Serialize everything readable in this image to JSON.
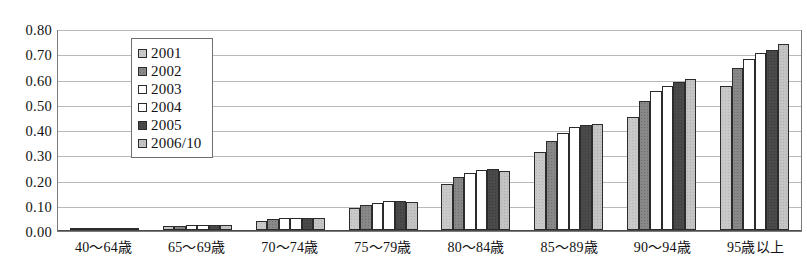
{
  "scan_artifact": {
    "top_clipped_text": " "
  },
  "chart_data": {
    "type": "bar",
    "title": "",
    "xlabel": "",
    "ylabel": "",
    "ylim": [
      0.0,
      0.8
    ],
    "yticks": [
      "0.00",
      "0.10",
      "0.20",
      "0.30",
      "0.40",
      "0.50",
      "0.60",
      "0.70",
      "0.80"
    ],
    "ytick_values": [
      0.0,
      0.1,
      0.2,
      0.3,
      0.4,
      0.5,
      0.6,
      0.7,
      0.8
    ],
    "grid": true,
    "legend_position": "upper-left-inside",
    "categories": [
      "40～64歳",
      "65～69歳",
      "70～74歳",
      "75～79歳",
      "80～84歳",
      "85～89歳",
      "90～94歳",
      "95歳以上"
    ],
    "series": [
      {
        "name": "2001",
        "color": "#c9c9c9",
        "values": [
          0.003,
          0.014,
          0.037,
          0.088,
          0.185,
          0.31,
          0.45,
          0.575
        ]
      },
      {
        "name": "2002",
        "color": "#888888",
        "values": [
          0.003,
          0.016,
          0.043,
          0.098,
          0.21,
          0.355,
          0.515,
          0.645
        ]
      },
      {
        "name": "2003",
        "color": "#ffffff",
        "values": [
          0.003,
          0.018,
          0.046,
          0.108,
          0.228,
          0.385,
          0.555,
          0.68
        ]
      },
      {
        "name": "2004",
        "color": "#ffffff",
        "values": [
          0.003,
          0.018,
          0.048,
          0.114,
          0.238,
          0.41,
          0.575,
          0.705
        ]
      },
      {
        "name": "2005",
        "color": "#4a4a4a",
        "values": [
          0.003,
          0.019,
          0.049,
          0.115,
          0.242,
          0.418,
          0.59,
          0.718
        ]
      },
      {
        "name": "2006/10",
        "color": "#c4c4c4",
        "values": [
          0.003,
          0.018,
          0.049,
          0.11,
          0.235,
          0.42,
          0.603,
          0.74
        ]
      }
    ]
  }
}
